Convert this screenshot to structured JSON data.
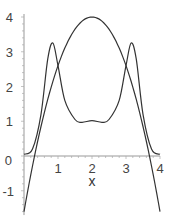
{
  "chart_data": {
    "type": "line",
    "title": "",
    "xlabel": "x",
    "ylabel": "",
    "xlim": [
      0,
      4
    ],
    "ylim": [
      -1.7,
      4
    ],
    "xticks": [
      "1",
      "2",
      "3",
      "4"
    ],
    "yticks": [
      "-1",
      "0",
      "1",
      "2",
      "3",
      "4"
    ],
    "grid": false,
    "series": [
      {
        "name": "parabola",
        "x": [
          0,
          0.5,
          1,
          1.5,
          2,
          2.5,
          3,
          3.5,
          4
        ],
        "values": [
          -1.6,
          0.85,
          2.6,
          3.65,
          4.0,
          3.65,
          2.6,
          0.85,
          -1.6
        ]
      },
      {
        "name": "double-peak",
        "x": [
          0,
          0.25,
          0.5,
          0.7,
          0.85,
          1.0,
          1.2,
          1.5,
          1.7,
          2.0,
          2.3,
          2.5,
          2.8,
          3.0,
          3.15,
          3.3,
          3.5,
          3.75,
          4
        ],
        "values": [
          0.05,
          0.2,
          1.2,
          2.8,
          3.25,
          2.6,
          1.6,
          1.05,
          0.97,
          1.02,
          0.97,
          1.05,
          1.6,
          2.6,
          3.25,
          2.8,
          1.2,
          0.2,
          0.05
        ]
      }
    ]
  }
}
